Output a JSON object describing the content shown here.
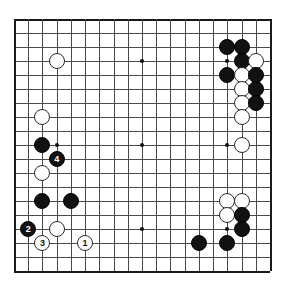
{
  "board": {
    "title": "Go board diagram",
    "size": 19,
    "origin_x": 14,
    "origin_y": 19,
    "spacing_x": 14.22,
    "spacing_y": 14.0,
    "line_color": "#4a4a4a",
    "edge_color": "#1a1a1a",
    "background_color": "#ffffff",
    "black_color": "#111111",
    "white_color": "#ffffff",
    "star_points": [
      {
        "col": 3,
        "row": 3
      },
      {
        "col": 9,
        "row": 3
      },
      {
        "col": 15,
        "row": 3
      },
      {
        "col": 3,
        "row": 9
      },
      {
        "col": 9,
        "row": 9
      },
      {
        "col": 15,
        "row": 9
      },
      {
        "col": 3,
        "row": 15
      },
      {
        "col": 9,
        "row": 15
      },
      {
        "col": 15,
        "row": 15
      }
    ],
    "stones": [
      {
        "col": 3,
        "row": 3,
        "color": "white",
        "label": ""
      },
      {
        "col": 16,
        "row": 2,
        "color": "black",
        "label": ""
      },
      {
        "col": 15,
        "row": 2,
        "color": "black",
        "label": ""
      },
      {
        "col": 16,
        "row": 3,
        "color": "black",
        "label": ""
      },
      {
        "col": 17,
        "row": 3,
        "color": "white",
        "label": ""
      },
      {
        "col": 15,
        "row": 4,
        "color": "black",
        "label": ""
      },
      {
        "col": 16,
        "row": 4,
        "color": "white",
        "label": ""
      },
      {
        "col": 17,
        "row": 4,
        "color": "black",
        "label": ""
      },
      {
        "col": 16,
        "row": 5,
        "color": "white",
        "label": ""
      },
      {
        "col": 17,
        "row": 5,
        "color": "black",
        "label": ""
      },
      {
        "col": 16,
        "row": 6,
        "color": "white",
        "label": ""
      },
      {
        "col": 17,
        "row": 6,
        "color": "black",
        "label": ""
      },
      {
        "col": 16,
        "row": 7,
        "color": "white",
        "label": ""
      },
      {
        "col": 2,
        "row": 7,
        "color": "white",
        "label": ""
      },
      {
        "col": 2,
        "row": 9,
        "color": "black",
        "label": ""
      },
      {
        "col": 3,
        "row": 10,
        "color": "black",
        "label": "4"
      },
      {
        "col": 2,
        "row": 11,
        "color": "white",
        "label": ""
      },
      {
        "col": 16,
        "row": 9,
        "color": "white",
        "label": ""
      },
      {
        "col": 2,
        "row": 13,
        "color": "black",
        "label": ""
      },
      {
        "col": 4,
        "row": 13,
        "color": "black",
        "label": ""
      },
      {
        "col": 15,
        "row": 13,
        "color": "white",
        "label": ""
      },
      {
        "col": 16,
        "row": 13,
        "color": "white",
        "label": ""
      },
      {
        "col": 15,
        "row": 14,
        "color": "white",
        "label": ""
      },
      {
        "col": 16,
        "row": 14,
        "color": "black",
        "label": ""
      },
      {
        "col": 16,
        "row": 15,
        "color": "black",
        "label": ""
      },
      {
        "col": 1,
        "row": 15,
        "color": "black",
        "label": "2"
      },
      {
        "col": 3,
        "row": 15,
        "color": "white",
        "label": ""
      },
      {
        "col": 2,
        "row": 16,
        "color": "white",
        "label": "3"
      },
      {
        "col": 5,
        "row": 16,
        "color": "white",
        "label": "1"
      },
      {
        "col": 13,
        "row": 16,
        "color": "black",
        "label": ""
      },
      {
        "col": 15,
        "row": 16,
        "color": "black",
        "label": ""
      }
    ]
  }
}
